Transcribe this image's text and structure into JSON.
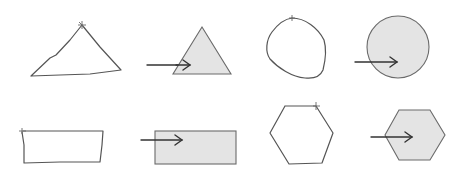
{
  "diagram": {
    "colors": {
      "background": "#ffffff",
      "sketch_stroke": "#555555",
      "shape_fill": "#e4e4e4",
      "shape_stroke": "#6a6a6a",
      "arrow": "#333333"
    },
    "pairs": [
      {
        "name": "triangle",
        "sketch_points": "31,76 50,58 56,55 70,40 82,25 100,47 121,70 90,74 60,75 31,76",
        "start_mark": [
          82,
          25
        ],
        "arrow": {
          "x1": 147,
          "y1": 65,
          "x2": 190,
          "y2": 65
        },
        "shape": {
          "type": "polygon",
          "points": "202,27 231,74 173,74"
        }
      },
      {
        "name": "circle",
        "sketch_path": "M292,18 C305,18 318,28 324,40 C327,50 325,62 323,70 C320,77 314,79 305,78 C292,77 278,68 270,59 C265,52 266,40 272,32 C278,24 284,19 292,18 Z",
        "start_mark": [
          292,
          18
        ],
        "arrow": {
          "x1": 355,
          "y1": 62,
          "x2": 397,
          "y2": 62
        },
        "shape": {
          "type": "circle",
          "cx": 398,
          "cy": 47,
          "r": 31
        }
      },
      {
        "name": "rectangle",
        "sketch_points": "23,131 103,131 102,145 100,162 60,162 24,163 24,145 22,132",
        "start_mark": [
          22,
          131
        ],
        "arrow": {
          "x1": 141,
          "y1": 140,
          "x2": 182,
          "y2": 140
        },
        "shape": {
          "type": "rect",
          "x": 155,
          "y": 131,
          "width": 81,
          "height": 33
        }
      },
      {
        "name": "hexagon",
        "sketch_points": "285,106 316,106 333,133 322,163 289,164 270,133 285,106",
        "start_mark": [
          316,
          106
        ],
        "arrow": {
          "x1": 371,
          "y1": 137,
          "x2": 412,
          "y2": 137
        },
        "shape": {
          "type": "polygon",
          "points": "399,110 430,110 445,135 430,160 399,160 385,135"
        }
      }
    ]
  }
}
